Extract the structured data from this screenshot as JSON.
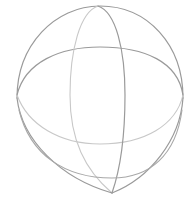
{
  "figure": {
    "background": "#ffffff",
    "stroke_dark": "#9a9a9a",
    "stroke_light": "#c8c8c8",
    "stroke_width": 1.2
  }
}
